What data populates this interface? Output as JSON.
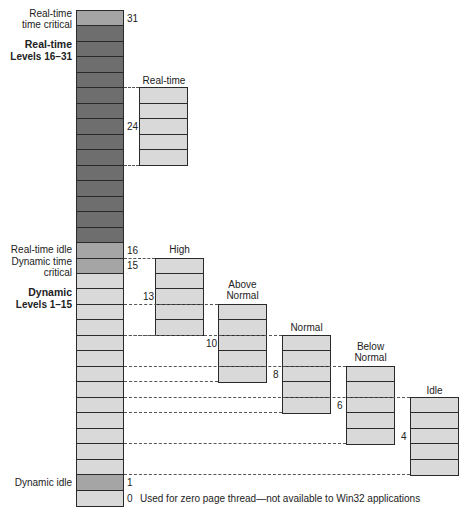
{
  "diagram": {
    "colors": {
      "dark": "#6e6e6e",
      "medium": "#a5a5a5",
      "light": "#d9d9d9",
      "border": "#2a2a2a"
    },
    "left_labels": {
      "rt_time_critical": [
        "Real-time",
        "time critical"
      ],
      "realtime_heading": "Real-time",
      "realtime_levels": "Levels 16–31",
      "rt_idle": "Real-time idle",
      "dyn_time_critical": [
        "Dynamic time",
        "critical"
      ],
      "dynamic_heading": "Dynamic",
      "dynamic_levels": "Levels 1–15",
      "dyn_idle": "Dynamic idle"
    },
    "level_numbers": {
      "n31": "31",
      "n24": "24",
      "n16": "16",
      "n15": "15",
      "n13": "13",
      "n10": "10",
      "n8": "8",
      "n6": "6",
      "n4": "4",
      "n1": "1",
      "n0": "0"
    },
    "zero_note": "Used for zero page thread—not available to Win32 applications",
    "priority_classes": [
      {
        "name": "Real-time",
        "lines": [
          "Real-time"
        ],
        "base": 24,
        "top_level": 26,
        "bottom_level": 22
      },
      {
        "name": "High",
        "lines": [
          "High"
        ],
        "base": 13,
        "top_level": 15,
        "bottom_level": 11
      },
      {
        "name": "Above Normal",
        "lines": [
          "Above",
          "Normal"
        ],
        "base": 10,
        "top_level": 12,
        "bottom_level": 8
      },
      {
        "name": "Normal",
        "lines": [
          "Normal"
        ],
        "base": 8,
        "top_level": 10,
        "bottom_level": 6
      },
      {
        "name": "Below Normal",
        "lines": [
          "Below",
          "Normal"
        ],
        "base": 6,
        "top_level": 8,
        "bottom_level": 4
      },
      {
        "name": "Idle",
        "lines": [
          "Idle"
        ],
        "base": 4,
        "top_level": 6,
        "bottom_level": 2
      }
    ]
  }
}
